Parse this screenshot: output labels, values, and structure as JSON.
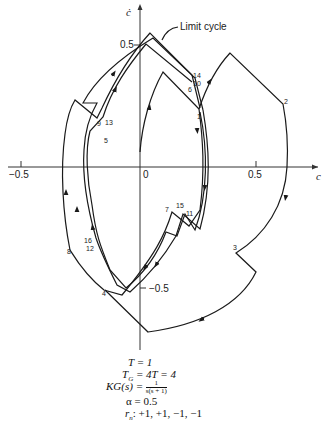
{
  "axes": {
    "x_label": "c",
    "y_label": "ċ",
    "x_ticks": [
      "−0.5",
      "0",
      "0.5"
    ],
    "y_ticks": [
      "0.5",
      "−0.5"
    ]
  },
  "callout": "Limit cycle",
  "point_labels": {
    "p1": "1",
    "p2": "2",
    "p3": "3",
    "p4": "4",
    "p5": "5",
    "p6": "6",
    "p7": "7",
    "p8": "8",
    "p9": "9",
    "p10": "10",
    "p11": "11",
    "p13": "13",
    "p14": "14",
    "p15": "15",
    "p16": "16",
    "p12": "12"
  },
  "params": {
    "T": "T = 1",
    "TG_lhs": "T",
    "TG_sub": "G",
    "TG_rhs": " = 4T = 4",
    "KG_lhs": "KG(s) = ",
    "KG_num": "1",
    "KG_den": "s(s + 1)",
    "alpha": "α = 0.5",
    "rn_lhs": "r",
    "rn_sub": "n",
    "rn_rhs": ": +1, +1, −1, −1"
  },
  "colors": {
    "line": "#1a1a1a",
    "background": "#ffffff"
  }
}
